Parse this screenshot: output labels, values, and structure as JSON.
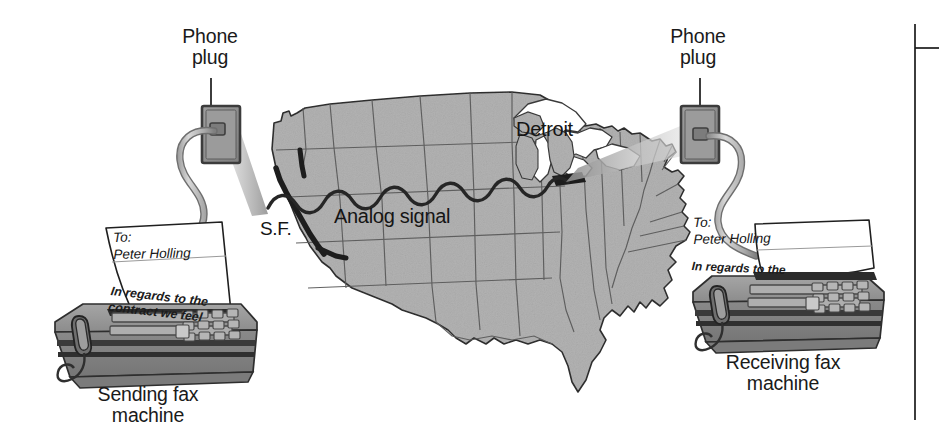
{
  "figure": {
    "background_color": "#ffffff"
  },
  "labels": {
    "plug_left": "Phone\nplug",
    "plug_right": "Phone\nplug",
    "caption_left": "Sending fax\nmachine",
    "caption_right": "Receiving fax\nmachine",
    "map_detroit": "Detroit",
    "map_analog_signal": "Analog signal",
    "map_sf": "S.F."
  },
  "paper_left": {
    "to_line": "To:\nPeter Holling",
    "body": "In regards to the\ncontract we feel"
  },
  "paper_right": {
    "to_line": "To:\nPeter Holling",
    "body": "In regards to the"
  },
  "colors": {
    "map_fill": "#b2b2b2",
    "map_stroke": "#4a4a4a",
    "map_outline": "#2b2b2b",
    "signal_line": "#262626",
    "fax_body_top": "#9a9a9a",
    "fax_body_front": "#8d8d8d",
    "fax_body_dark": "#3a3a3a",
    "cord": "#b9b9b9",
    "cord_stroke": "#6e6e6e",
    "plug_plate": "#8f8f8f",
    "plug_border": "#3c3c3c",
    "beam": "#c9c9c9",
    "paper": "#ffffff",
    "text": "#1a1a1a",
    "rule": "#1a1a1a"
  },
  "icons": {
    "phone_plug_left": "phone-plug-icon",
    "phone_plug_right": "phone-plug-icon",
    "us_map": "us-map-icon",
    "fax_machine_left": "fax-machine-icon",
    "fax_machine_right": "fax-machine-icon",
    "signal_wave": "analog-wave-icon",
    "leader_line_left": "leader-line",
    "leader_line_right": "leader-line",
    "margin_rule": "page-margin-rule"
  }
}
